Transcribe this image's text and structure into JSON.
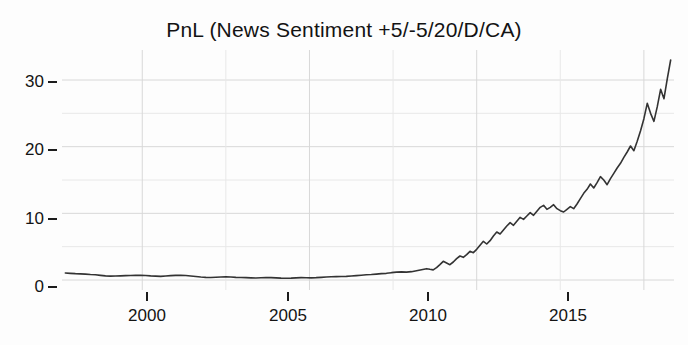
{
  "chart_data": {
    "type": "line",
    "title": "PnL (News Sentiment +5/-5/20/D/CA)",
    "xlabel": "",
    "ylabel": "",
    "xlim": [
      1997.6,
      2015.9
    ],
    "ylim": [
      -1.5,
      34.5
    ],
    "grid": true,
    "grid_major_y": [
      0,
      10,
      20,
      30
    ],
    "grid_minor_y": [
      5,
      15,
      25
    ],
    "grid_major_x": [
      2000,
      2005,
      2010,
      2015
    ],
    "grid_minor_x": [
      1997.5,
      2002.5,
      2007.5,
      2012.5
    ],
    "legend": "none",
    "line_color": "#333333",
    "line_width": 1.6,
    "background_color": "#fdfdfd",
    "grid_color": "#d8d8d8",
    "x_ticks": [
      2000,
      2005,
      2010,
      2015
    ],
    "x_tick_labels": [
      "2000",
      "2005",
      "2010",
      "2015"
    ],
    "y_ticks": [
      0,
      10,
      20,
      30
    ],
    "y_tick_labels": [
      "0",
      "10",
      "20",
      "30"
    ],
    "series": [
      {
        "name": "PnL",
        "x": [
          1997.7,
          1997.85,
          1998.0,
          1998.15,
          1998.3,
          1998.45,
          1998.6,
          1998.75,
          1998.9,
          1999.05,
          1999.2,
          1999.35,
          1999.5,
          1999.65,
          1999.8,
          1999.95,
          2000.1,
          2000.25,
          2000.4,
          2000.55,
          2000.7,
          2000.85,
          2001.0,
          2001.15,
          2001.3,
          2001.45,
          2001.6,
          2001.75,
          2001.9,
          2002.05,
          2002.2,
          2002.35,
          2002.5,
          2002.65,
          2002.8,
          2002.95,
          2003.1,
          2003.25,
          2003.4,
          2003.55,
          2003.7,
          2003.85,
          2004.0,
          2004.15,
          2004.3,
          2004.45,
          2004.6,
          2004.75,
          2004.9,
          2005.05,
          2005.2,
          2005.35,
          2005.5,
          2005.65,
          2005.8,
          2005.95,
          2006.1,
          2006.25,
          2006.4,
          2006.55,
          2006.7,
          2006.85,
          2007.0,
          2007.15,
          2007.3,
          2007.45,
          2007.6,
          2007.75,
          2007.9,
          2008.05,
          2008.2,
          2008.35,
          2008.5,
          2008.6,
          2008.7,
          2008.8,
          2008.9,
          2009.0,
          2009.1,
          2009.2,
          2009.3,
          2009.4,
          2009.5,
          2009.6,
          2009.7,
          2009.8,
          2009.9,
          2010.0,
          2010.1,
          2010.2,
          2010.3,
          2010.4,
          2010.5,
          2010.6,
          2010.7,
          2010.8,
          2010.9,
          2011.0,
          2011.1,
          2011.2,
          2011.3,
          2011.4,
          2011.5,
          2011.6,
          2011.7,
          2011.8,
          2011.9,
          2012.0,
          2012.1,
          2012.2,
          2012.3,
          2012.4,
          2012.5,
          2012.6,
          2012.7,
          2012.8,
          2012.9,
          2013.0,
          2013.1,
          2013.2,
          2013.3,
          2013.4,
          2013.5,
          2013.6,
          2013.7,
          2013.8,
          2013.9,
          2014.0,
          2014.1,
          2014.2,
          2014.3,
          2014.4,
          2014.5,
          2014.6,
          2014.7,
          2014.8,
          2014.9,
          2015.0,
          2015.1,
          2015.2,
          2015.3,
          2015.4,
          2015.5,
          2015.6,
          2015.7,
          2015.8
        ],
        "y": [
          1.05,
          1.0,
          0.95,
          0.92,
          0.88,
          0.82,
          0.78,
          0.7,
          0.62,
          0.58,
          0.6,
          0.62,
          0.65,
          0.68,
          0.7,
          0.72,
          0.68,
          0.62,
          0.58,
          0.55,
          0.6,
          0.66,
          0.7,
          0.72,
          0.68,
          0.6,
          0.52,
          0.45,
          0.4,
          0.38,
          0.42,
          0.46,
          0.48,
          0.44,
          0.4,
          0.38,
          0.35,
          0.32,
          0.3,
          0.34,
          0.38,
          0.36,
          0.32,
          0.28,
          0.26,
          0.28,
          0.32,
          0.36,
          0.34,
          0.32,
          0.35,
          0.4,
          0.45,
          0.48,
          0.5,
          0.52,
          0.55,
          0.6,
          0.66,
          0.72,
          0.78,
          0.82,
          0.88,
          0.95,
          1.0,
          1.1,
          1.18,
          1.22,
          1.18,
          1.25,
          1.4,
          1.55,
          1.7,
          1.6,
          1.52,
          1.85,
          2.3,
          2.8,
          2.55,
          2.3,
          2.7,
          3.2,
          3.6,
          3.4,
          3.8,
          4.3,
          4.1,
          4.6,
          5.2,
          5.8,
          5.4,
          5.9,
          6.6,
          7.2,
          6.9,
          7.5,
          8.1,
          8.6,
          8.2,
          8.8,
          9.4,
          9.1,
          9.6,
          10.1,
          9.7,
          10.3,
          10.9,
          11.2,
          10.6,
          10.9,
          11.3,
          10.7,
          10.4,
          10.2,
          10.6,
          11.0,
          10.7,
          11.4,
          12.2,
          13.0,
          13.6,
          14.4,
          13.8,
          14.6,
          15.5,
          15.0,
          14.3,
          15.2,
          16.0,
          16.8,
          17.5,
          18.4,
          19.2,
          20.1,
          19.4,
          20.8,
          22.4,
          24.2,
          26.5,
          25.0,
          23.8,
          26.0,
          28.6,
          27.2,
          30.2,
          33.0
        ]
      }
    ]
  },
  "axes": {
    "y_tick_labels": [
      "30",
      "20",
      "10",
      "0"
    ],
    "x_tick_labels": [
      "2000",
      "2005",
      "2010",
      "2015"
    ]
  }
}
